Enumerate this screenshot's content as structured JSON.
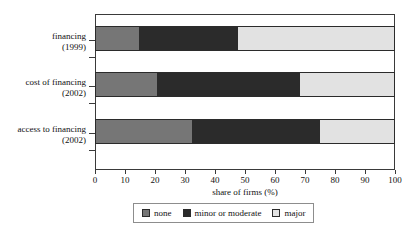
{
  "chart_data": {
    "type": "bar",
    "orientation": "horizontal",
    "stacked": true,
    "stacked_mode": "percent",
    "title": "",
    "subtitle": "",
    "xlabel": "share of firms (%)",
    "ylabel": "",
    "xlim": [
      0,
      100
    ],
    "xticks": [
      0,
      10,
      20,
      30,
      40,
      50,
      60,
      70,
      80,
      90,
      100
    ],
    "xticklabels": [
      "0",
      "10",
      "20",
      "30",
      "40",
      "50",
      "60",
      "70",
      "80",
      "90",
      "100"
    ],
    "grid": false,
    "legend_position": "bottom",
    "categories": [
      {
        "line1": "financing",
        "line2": "(1999)"
      },
      {
        "line1": "cost of financing",
        "line2": "(2002)"
      },
      {
        "line1": "access to financing",
        "line2": "(2002)"
      }
    ],
    "series": [
      {
        "name": "none",
        "color": "#767676",
        "values": [
          14.7,
          20.7,
          32.3
        ]
      },
      {
        "name": "minor or moderate",
        "color": "#2b2b2b",
        "values": [
          33.0,
          47.8,
          42.7
        ]
      },
      {
        "name": "major",
        "color": "#e2e2e2",
        "values": [
          52.3,
          31.5,
          25.0
        ]
      }
    ],
    "legend": [
      {
        "label": "none",
        "color": "#767676"
      },
      {
        "label": "minor or moderate",
        "color": "#2b2b2b"
      },
      {
        "label": "major",
        "color": "#e2e2e2"
      }
    ],
    "annotations": []
  },
  "colors": {
    "none": "#767676",
    "minor_or_moderate": "#2b2b2b",
    "major": "#e2e2e2",
    "axis": "#3a3a3a",
    "text": "#111111",
    "background": "#ffffff"
  }
}
